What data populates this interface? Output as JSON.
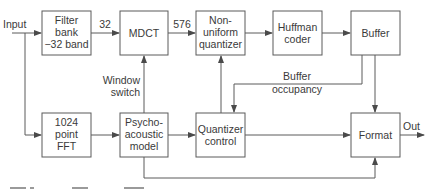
{
  "diagram": {
    "colors": {
      "stroke": "#5a5a5a",
      "text": "#3a3a3a",
      "background": "#ffffff"
    },
    "blocks": {
      "filter_bank": {
        "lines": [
          "Filter",
          "bank",
          "−32 band"
        ]
      },
      "mdct": {
        "lines": [
          "MDCT"
        ]
      },
      "nonuniform_quantizer": {
        "lines": [
          "Non-",
          "uniform",
          "quantizer"
        ]
      },
      "huffman_coder": {
        "lines": [
          "Huffman",
          "coder"
        ]
      },
      "buffer": {
        "lines": [
          "Buffer"
        ]
      },
      "fft": {
        "lines": [
          "1024",
          "point",
          "FFT"
        ]
      },
      "psychoacoustic_model": {
        "lines": [
          "Psycho-",
          "acoustic",
          "model"
        ]
      },
      "quantizer_control": {
        "lines": [
          "Quantizer",
          "control"
        ]
      },
      "format": {
        "lines": [
          "Format"
        ]
      }
    },
    "labels": {
      "input": "Input",
      "output": "Out",
      "bands_32": "32",
      "coeffs_576": "576",
      "window_switch": [
        "Window",
        "switch"
      ],
      "buffer_occupancy": [
        "Buffer",
        "occupancy"
      ]
    }
  }
}
